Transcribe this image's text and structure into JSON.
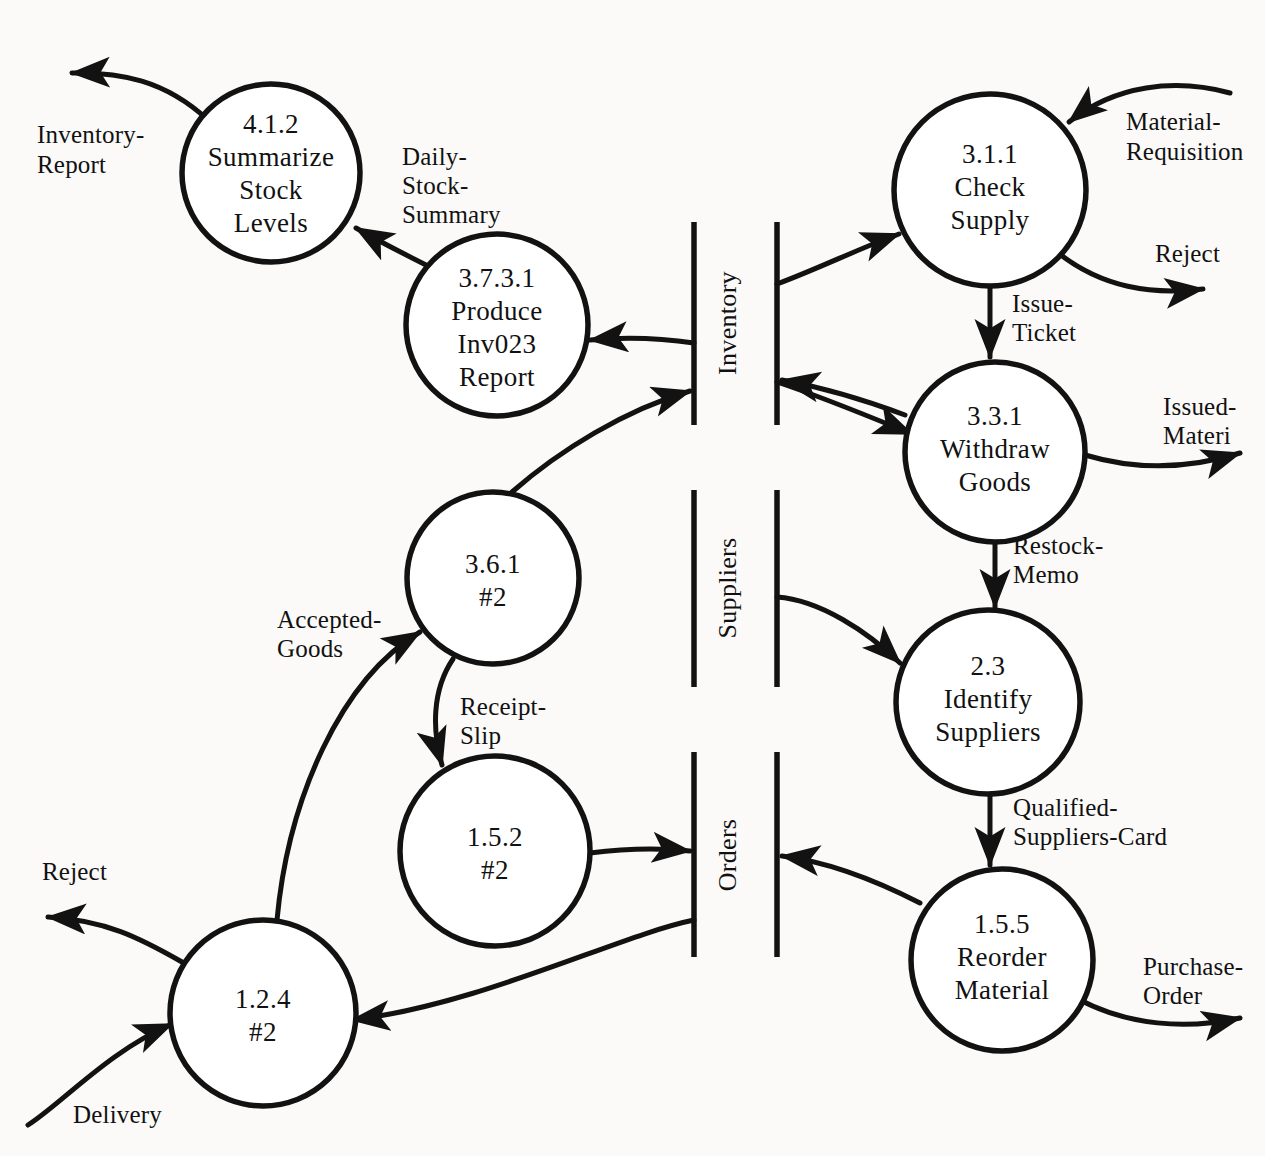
{
  "diagram": {
    "type": "data-flow-diagram",
    "background_color": "#fbfaf8",
    "ink_color": "#121212"
  },
  "processes": [
    {
      "id": "p412",
      "number": "4.1.2",
      "lines": [
        "4.1.2",
        "Summarize",
        "Stock",
        "Levels"
      ],
      "cx": 271,
      "cy": 173,
      "r": 89
    },
    {
      "id": "p3731",
      "number": "3.7.3.1",
      "lines": [
        "3.7.3.1",
        "Produce",
        "Inv023",
        "Report"
      ],
      "cx": 497,
      "cy": 325,
      "r": 91
    },
    {
      "id": "p311",
      "number": "3.1.1",
      "lines": [
        "3.1.1",
        "Check",
        "Supply"
      ],
      "cx": 990,
      "cy": 190,
      "r": 96
    },
    {
      "id": "p331",
      "number": "3.3.1",
      "lines": [
        "3.3.1",
        "Withdraw",
        "Goods"
      ],
      "cx": 995,
      "cy": 452,
      "r": 90
    },
    {
      "id": "p361",
      "number": "3.6.1",
      "lines": [
        "3.6.1",
        "#2"
      ],
      "cx": 493,
      "cy": 578,
      "r": 86
    },
    {
      "id": "p23",
      "number": "2.3",
      "lines": [
        "2.3",
        "Identify",
        "Suppliers"
      ],
      "cx": 988,
      "cy": 702,
      "r": 92
    },
    {
      "id": "p152",
      "number": "1.5.2",
      "lines": [
        "1.5.2",
        "#2"
      ],
      "cx": 495,
      "cy": 851,
      "r": 95
    },
    {
      "id": "p124",
      "number": "1.2.4",
      "lines": [
        "1.2.4",
        "#2"
      ],
      "cx": 263,
      "cy": 1013,
      "r": 93
    },
    {
      "id": "p155",
      "number": "1.5.5",
      "lines": [
        "1.5.5",
        "Reorder",
        "Material"
      ],
      "cx": 1002,
      "cy": 960,
      "r": 91
    }
  ],
  "data_stores": [
    {
      "id": "ds-inventory",
      "label": "Inventory",
      "left_bar_x": 694,
      "right_bar_x": 777,
      "top_y": 222,
      "bottom_y": 425,
      "label_x": 736,
      "label_y": 323
    },
    {
      "id": "ds-suppliers",
      "label": "Suppliers",
      "left_bar_x": 694,
      "right_bar_x": 777,
      "top_y": 490,
      "bottom_y": 687,
      "label_x": 736,
      "label_y": 588
    },
    {
      "id": "ds-orders",
      "label": "Orders",
      "left_bar_x": 694,
      "right_bar_x": 777,
      "top_y": 752,
      "bottom_y": 957,
      "label_x": 736,
      "label_y": 855
    }
  ],
  "flows": [
    {
      "id": "f-inventory-report",
      "label": "Inventory-\nReport",
      "label_lines": [
        "Inventory-",
        "Report"
      ],
      "lx": 37,
      "ly": 143
    },
    {
      "id": "f-daily-stock-summary",
      "label": "Daily-Stock-Summary",
      "label_lines": [
        "Daily-",
        "Stock-",
        "Summary"
      ],
      "lx": 402,
      "ly": 165
    },
    {
      "id": "f-material-requisition",
      "label": "Material-Requisition",
      "label_lines": [
        "Material-",
        "Requisition"
      ],
      "lx": 1126,
      "ly": 130
    },
    {
      "id": "f-reject-top",
      "label": "Reject",
      "label_lines": [
        "Reject"
      ],
      "lx": 1155,
      "ly": 262
    },
    {
      "id": "f-issue-ticket",
      "label": "Issue-Ticket",
      "label_lines": [
        "Issue-",
        "Ticket"
      ],
      "lx": 1012,
      "ly": 312
    },
    {
      "id": "f-issued-material",
      "label": "Issued-Materi",
      "label_lines": [
        "Issued-",
        "Materi"
      ],
      "lx": 1163,
      "ly": 415
    },
    {
      "id": "f-restock-memo",
      "label": "Restock-Memo",
      "label_lines": [
        "Restock-",
        "Memo"
      ],
      "lx": 1013,
      "ly": 554
    },
    {
      "id": "f-accepted-goods",
      "label": "Accepted-Goods",
      "label_lines": [
        "Accepted-",
        "Goods"
      ],
      "lx": 277,
      "ly": 628
    },
    {
      "id": "f-receipt-slip",
      "label": "Receipt-Slip",
      "label_lines": [
        "Receipt-",
        "Slip"
      ],
      "lx": 460,
      "ly": 715
    },
    {
      "id": "f-qualified-suppliers-card",
      "label": "Qualified-Suppliers-Card",
      "label_lines": [
        "Qualified-",
        "Suppliers-Card"
      ],
      "lx": 1013,
      "ly": 816
    },
    {
      "id": "f-reject-bottom",
      "label": "Reject",
      "label_lines": [
        "Reject"
      ],
      "lx": 42,
      "ly": 880
    },
    {
      "id": "f-purchase-order",
      "label": "Purchase-Order",
      "label_lines": [
        "Purchase-",
        "Order"
      ],
      "lx": 1143,
      "ly": 975
    },
    {
      "id": "f-delivery",
      "label": "Delivery",
      "label_lines": [
        "Delivery"
      ],
      "lx": 73,
      "ly": 1123
    }
  ]
}
